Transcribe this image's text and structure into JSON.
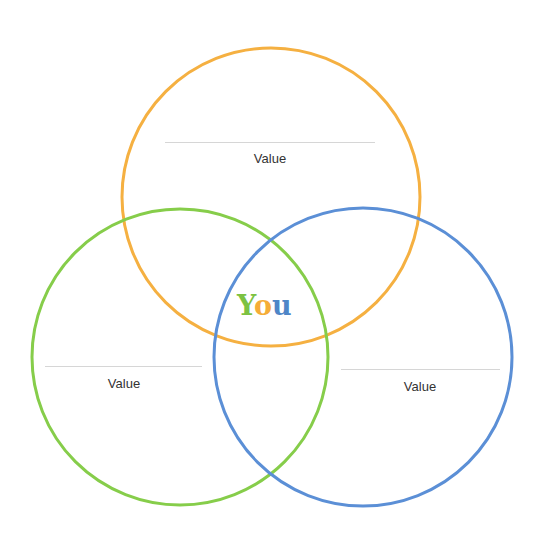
{
  "diagram": {
    "type": "venn",
    "center_label": {
      "letters": [
        "Y",
        "o",
        "u"
      ],
      "colors": [
        "#7cc242",
        "#f5ad37",
        "#4e86c7"
      ]
    },
    "circles": [
      {
        "name": "top",
        "color": "#f5b041",
        "cx": 271,
        "cy": 197,
        "r": 150,
        "label": "Value"
      },
      {
        "name": "left",
        "color": "#86cd4a",
        "cx": 180,
        "cy": 357,
        "r": 150,
        "label": "Value"
      },
      {
        "name": "right",
        "color": "#5b8fd6",
        "cx": 363,
        "cy": 357,
        "r": 150,
        "label": "Value"
      }
    ]
  }
}
